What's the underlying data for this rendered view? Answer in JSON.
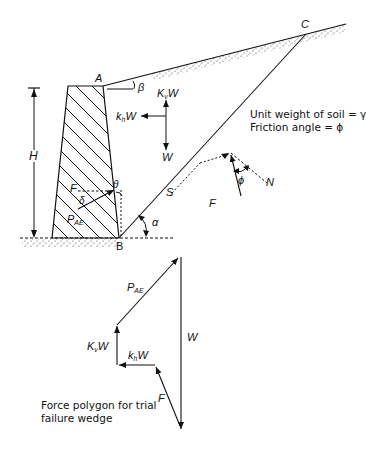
{
  "diagram": {
    "type": "retaining-wall-trial-failure-wedge",
    "points": {
      "A": "A",
      "B": "B",
      "C": "C"
    },
    "labels": {
      "height": "H",
      "slope_angle": "β",
      "vertical_seismic": "K",
      "vertical_seismic_sub": "v",
      "vertical_seismic_w": "W",
      "horizontal_seismic": "k",
      "horizontal_seismic_sub": "h",
      "horizontal_seismic_w": "W",
      "weight": "W",
      "wall_friction": "δ",
      "wall_angle": "θ",
      "wedge_angle": "α",
      "friction_angle": "ϕ",
      "F": "F",
      "S": "S",
      "N": "N",
      "F_resultant": "F",
      "P": "P",
      "P_sub": "AE"
    },
    "soil_properties": {
      "line1": "Unit weight of soil = γ",
      "line2": "Friction angle = ϕ"
    },
    "force_polygon": {
      "labels": {
        "P": "P",
        "P_sub": "AE",
        "W": "W",
        "Kv": "K",
        "Kv_sub": "v",
        "Kv_w": "W",
        "kh": "k",
        "kh_sub": "h",
        "kh_w": "W",
        "F": "F"
      },
      "caption_line1": "Force polygon for trial",
      "caption_line2": "failure wedge"
    }
  }
}
